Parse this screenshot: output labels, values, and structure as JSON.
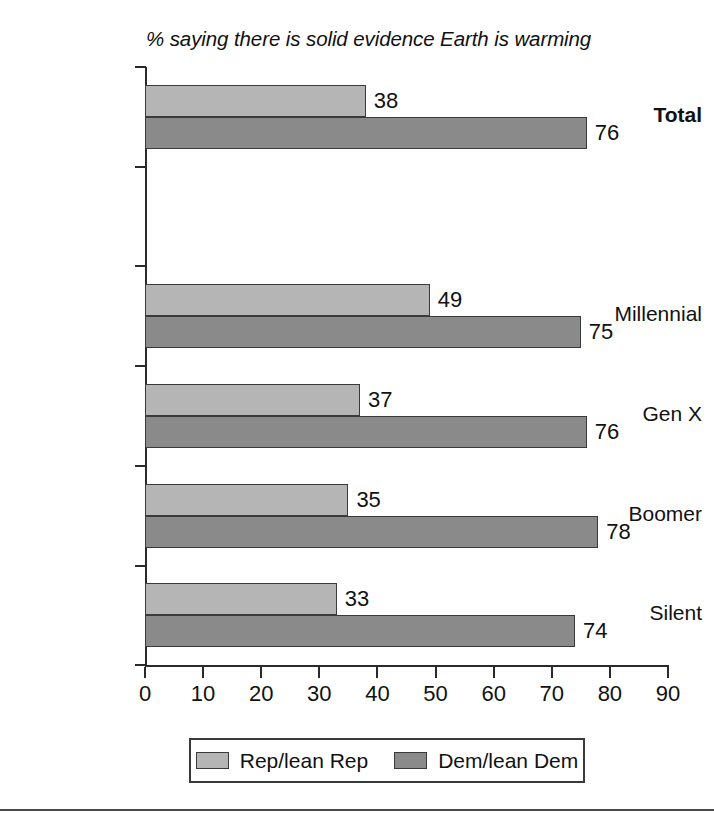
{
  "chart_data": {
    "type": "bar",
    "orientation": "horizontal",
    "title": "% saying there is solid evidence Earth is warming",
    "xlabel": "",
    "ylabel": "",
    "xlim": [
      0,
      90
    ],
    "xticks": [
      0,
      10,
      20,
      30,
      40,
      50,
      60,
      70,
      80,
      90
    ],
    "grid": false,
    "legend_position": "bottom",
    "categories": [
      "Total",
      "",
      "Millennial",
      "Gen X",
      "Boomer",
      "Silent"
    ],
    "series": [
      {
        "name": "Rep/lean Rep",
        "color": "#b5b5b5",
        "values": [
          38,
          null,
          49,
          37,
          35,
          33
        ]
      },
      {
        "name": "Dem/lean Dem",
        "color": "#8a8a8a",
        "values": [
          76,
          null,
          75,
          76,
          78,
          74
        ]
      }
    ],
    "bars": [
      {
        "category": "Total",
        "bold": true,
        "rep": 38,
        "dem": 76
      },
      {
        "category": "",
        "bold": false,
        "rep": null,
        "dem": null
      },
      {
        "category": "Millennial",
        "bold": false,
        "rep": 49,
        "dem": 75
      },
      {
        "category": "Gen X",
        "bold": false,
        "rep": 37,
        "dem": 76
      },
      {
        "category": "Boomer",
        "bold": false,
        "rep": 35,
        "dem": 78
      },
      {
        "category": "Silent",
        "bold": false,
        "rep": 33,
        "dem": 74
      }
    ]
  },
  "legend": {
    "items": [
      {
        "label": "Rep/lean Rep",
        "color": "#b5b5b5"
      },
      {
        "label": "Dem/lean Dem",
        "color": "#8a8a8a"
      }
    ]
  },
  "axis": {
    "tick_labels": [
      "0",
      "10",
      "20",
      "30",
      "40",
      "50",
      "60",
      "70",
      "80",
      "90"
    ]
  },
  "category_labels": [
    "Total",
    "",
    "Millennial",
    "Gen X",
    "Boomer",
    "Silent"
  ],
  "values": {
    "total_rep": "38",
    "total_dem": "76",
    "millennial_rep": "49",
    "millennial_dem": "75",
    "genx_rep": "37",
    "genx_dem": "76",
    "boomer_rep": "35",
    "boomer_dem": "78",
    "silent_rep": "33",
    "silent_dem": "74"
  },
  "colors": {
    "rep": "#b5b5b5",
    "dem": "#8a8a8a",
    "axis": "#2a2a2a",
    "text": "#111111",
    "background": "#ffffff"
  }
}
